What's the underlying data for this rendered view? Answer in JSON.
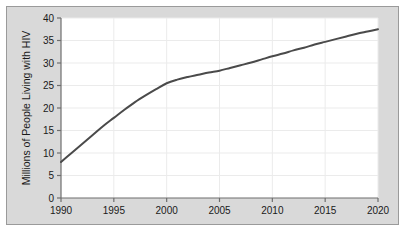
{
  "chart_data": {
    "type": "line",
    "title": "",
    "subtitle": "",
    "xlabel": "",
    "ylabel": "Millions of People Living with HIV",
    "x": [
      1990,
      1991,
      1992,
      1993,
      1994,
      1995,
      1996,
      1997,
      1998,
      1999,
      2000,
      2001,
      2002,
      2003,
      2004,
      2005,
      2006,
      2007,
      2008,
      2009,
      2010,
      2011,
      2012,
      2013,
      2014,
      2015,
      2016,
      2017,
      2018,
      2019,
      2020
    ],
    "values": [
      8.0,
      10.0,
      12.0,
      14.0,
      16.0,
      17.8,
      19.6,
      21.3,
      22.8,
      24.2,
      25.5,
      26.3,
      26.9,
      27.4,
      27.9,
      28.3,
      28.9,
      29.5,
      30.1,
      30.8,
      31.5,
      32.1,
      32.8,
      33.4,
      34.1,
      34.7,
      35.3,
      35.9,
      36.5,
      37.0,
      37.5
    ],
    "series": [
      {
        "name": "Millions of People Living with HIV",
        "values": [
          8.0,
          10.0,
          12.0,
          14.0,
          16.0,
          17.8,
          19.6,
          21.3,
          22.8,
          24.2,
          25.5,
          26.3,
          26.9,
          27.4,
          27.9,
          28.3,
          28.9,
          29.5,
          30.1,
          30.8,
          31.5,
          32.1,
          32.8,
          33.4,
          34.1,
          34.7,
          35.3,
          35.9,
          36.5,
          37.0,
          37.5
        ],
        "color": "#4a4a4a"
      }
    ],
    "xlim": [
      1990,
      2020
    ],
    "ylim": [
      0,
      40
    ],
    "x_ticks": [
      1990,
      1995,
      2000,
      2005,
      2010,
      2015,
      2020
    ],
    "x_tick_labels": [
      "1990",
      "1995",
      "2000",
      "2005",
      "2010",
      "2015",
      "2020"
    ],
    "y_ticks": [
      0,
      5,
      10,
      15,
      20,
      25,
      30,
      35,
      40
    ],
    "y_tick_labels": [
      "0",
      "5",
      "10",
      "15",
      "20",
      "25",
      "30",
      "35",
      "40"
    ],
    "grid": true,
    "grid_color": "#ebebeb",
    "legend": false,
    "legend_position": "none",
    "plot_background": "#ffffff",
    "figure_background": "#d9d9d9",
    "axis_color": "#6e6e6e",
    "line_color": "#4a4a4a",
    "line_width": 2
  }
}
